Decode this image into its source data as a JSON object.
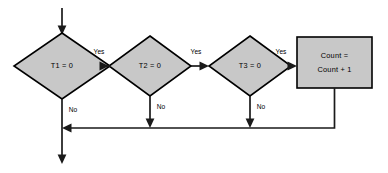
{
  "diagram": {
    "type": "flowchart",
    "colors": {
      "node_fill": "#c8c8c8",
      "node_stroke": "#000000",
      "edge_stroke": "#1a1a1a",
      "background": "#ffffff",
      "text": "#000000"
    },
    "nodes": [
      {
        "id": "decision-t1",
        "shape": "diamond",
        "label": "T1 = 0",
        "cx": 62,
        "cy": 66,
        "rx": 48,
        "ry": 33
      },
      {
        "id": "decision-t2",
        "shape": "diamond",
        "label": "T2 = 0",
        "cx": 150,
        "cy": 66,
        "rx": 41,
        "ry": 30
      },
      {
        "id": "decision-t3",
        "shape": "diamond",
        "label": "T3 = 0",
        "cx": 250,
        "cy": 66,
        "rx": 41,
        "ry": 30
      },
      {
        "id": "process-count",
        "shape": "rectangle",
        "label_line1": "Count =",
        "label_line2": "Count + 1",
        "x": 297,
        "y": 37,
        "width": 75,
        "height": 51
      }
    ],
    "edge_labels": {
      "yes_t1": "Yes",
      "yes_t2": "Yes",
      "yes_t3": "Yes",
      "no_t1": "No",
      "no_t2": "No",
      "no_t3": "No"
    }
  }
}
